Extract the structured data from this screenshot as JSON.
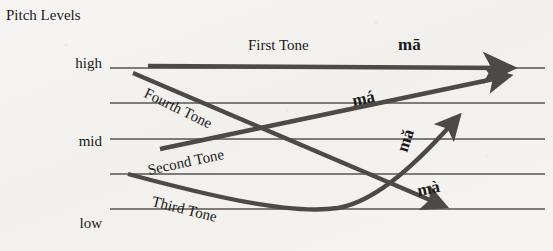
{
  "figure": {
    "axis_title": "Pitch Levels",
    "background_color": "#f4f3f1",
    "ink_color": "#4c4a47",
    "staff_line_color": "#565450"
  },
  "levels": [
    {
      "name": "high",
      "label": "high",
      "y": 68
    },
    {
      "name": "mid",
      "label": "mid",
      "y": 139
    },
    {
      "name": "low",
      "label": "low",
      "y": 209
    }
  ],
  "staff_lines": [
    {
      "y": 68,
      "x1": 110,
      "x2": 545
    },
    {
      "y": 103,
      "x1": 110,
      "x2": 545
    },
    {
      "y": 139,
      "x1": 110,
      "x2": 545
    },
    {
      "y": 174,
      "x1": 110,
      "x2": 545
    },
    {
      "y": 209,
      "x1": 110,
      "x2": 545
    }
  ],
  "tones": [
    {
      "id": "first",
      "name_label": "First Tone",
      "syllable": "mā",
      "description": "high level",
      "start": [
        148,
        66
      ],
      "end": [
        520,
        68
      ],
      "path": "M148,66 L512,68",
      "name_pos": [
        248,
        38
      ],
      "name_rotation": 0,
      "syllable_pos": [
        398,
        36
      ],
      "syllable_rotation": 0
    },
    {
      "id": "second",
      "name_label": "Second Tone",
      "syllable": "má",
      "description": "rising",
      "start": [
        160,
        149
      ],
      "end": [
        516,
        74
      ],
      "path": "M160,149 L508,76",
      "name_pos": [
        148,
        163
      ],
      "name_rotation": -12,
      "syllable_pos": [
        352,
        90
      ],
      "syllable_rotation": -12
    },
    {
      "id": "third",
      "name_label": "Third Tone",
      "syllable": "mǎ",
      "description": "falling-rising",
      "start": [
        128,
        174
      ],
      "end": [
        463,
        112
      ],
      "path": "M128,174 C210,196 290,215 338,208 C378,201 420,160 458,117",
      "name_pos": [
        152,
        194
      ],
      "name_rotation": 14,
      "syllable_pos": [
        403,
        137
      ],
      "syllable_rotation": -72
    },
    {
      "id": "fourth",
      "name_label": "Fourth Tone",
      "syllable": "mà",
      "description": "falling",
      "start": [
        133,
        73
      ],
      "end": [
        451,
        210
      ],
      "path": "M133,73 L444,206",
      "name_pos": [
        145,
        85
      ],
      "name_rotation": 26,
      "syllable_pos": [
        423,
        185
      ],
      "syllable_rotation": -12
    }
  ]
}
